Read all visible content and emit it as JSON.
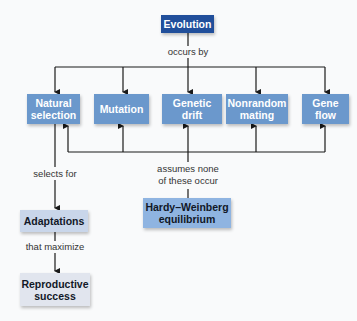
{
  "diagram": {
    "nodes": {
      "evolution": "Evolution",
      "natural_selection": "Natural\nselection",
      "mutation": "Mutation",
      "genetic_drift": "Genetic\ndrift",
      "nonrandom_mating": "Nonrandom\nmating",
      "gene_flow": "Gene\nflow",
      "hardy_weinberg": "Hardy–Weinberg\nequilibrium",
      "adaptations": "Adaptations",
      "reproductive_success": "Reproductive\nsuccess"
    },
    "edge_labels": {
      "occurs_by": "occurs by",
      "assumes_none": "assumes none\nof these occur",
      "selects_for": "selects for",
      "that_maximize": "that maximize"
    },
    "edges": [
      {
        "from": "evolution",
        "to": [
          "natural_selection",
          "mutation",
          "genetic_drift",
          "nonrandom_mating",
          "gene_flow"
        ],
        "label": "occurs by"
      },
      {
        "from": "hardy_weinberg",
        "to": [
          "natural_selection",
          "mutation",
          "genetic_drift",
          "nonrandom_mating",
          "gene_flow"
        ],
        "label": "assumes none of these occur"
      },
      {
        "from": "natural_selection",
        "to": "adaptations",
        "label": "selects for"
      },
      {
        "from": "adaptations",
        "to": "reproductive_success",
        "label": "that maximize"
      }
    ],
    "colors": {
      "evolution": "#214f9b",
      "mechanisms": "#6b98cc",
      "hardy_weinberg": "#8fb4e1",
      "adaptations": "#c9d6ea",
      "reproductive_success": "#e1e5ee",
      "background": "#f9fafb"
    }
  }
}
